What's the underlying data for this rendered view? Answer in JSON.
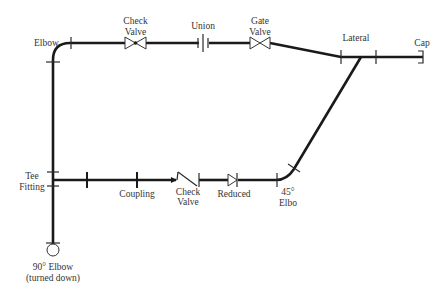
{
  "diagram": {
    "type": "piping-isometric-schematic",
    "labels": {
      "elbow": "Elbow",
      "check_valve_top_1": "Check",
      "check_valve_top_2": "Valve",
      "union": "Union",
      "gate_valve_1": "Gate",
      "gate_valve_2": "Valve",
      "lateral": "Lateral",
      "cap": "Cap",
      "tee_1": "Tee",
      "tee_2": "Fitting",
      "coupling": "Coupling",
      "check_valve_bottom_1": "Check",
      "check_valve_bottom_2": "Valve",
      "reduced": "Reduced",
      "elbow45_1": "45°",
      "elbow45_2": "Elbo",
      "elbow90_1": "90° Elbow",
      "elbow90_2": "(turned down)"
    },
    "components": [
      {
        "name": "Elbow",
        "type": "90-degree elbow"
      },
      {
        "name": "Check Valve",
        "type": "check valve (top run)"
      },
      {
        "name": "Union",
        "type": "union"
      },
      {
        "name": "Gate Valve",
        "type": "gate valve"
      },
      {
        "name": "Lateral",
        "type": "lateral (45° branch)"
      },
      {
        "name": "Cap",
        "type": "end cap"
      },
      {
        "name": "Tee Fitting",
        "type": "tee"
      },
      {
        "name": "Coupling",
        "type": "coupling"
      },
      {
        "name": "Check Valve",
        "type": "check valve (bottom run)"
      },
      {
        "name": "Reduced",
        "type": "reducer"
      },
      {
        "name": "45° Elbo",
        "type": "45-degree elbow"
      },
      {
        "name": "90° Elbow (turned down)",
        "type": "90-degree elbow turned down"
      }
    ],
    "colors": {
      "pipe": "#1a1a1a",
      "symbol": "#333333",
      "background": "#ffffff"
    }
  }
}
